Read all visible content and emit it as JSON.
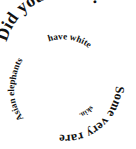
{
  "image": {
    "kind": "spiral-text-graphic",
    "width": 136,
    "height": 149,
    "background_color": "#ffffff",
    "text_color": "#111111"
  },
  "spiral": {
    "full_text": "Did you know? Some very rare Asian elephants have white skin.",
    "segments": [
      {
        "id": "segment-1",
        "text": "Did you know?",
        "ring": "outer",
        "note": "largest bold serif, arcs across the top from upper-left down the right side"
      },
      {
        "id": "segment-2",
        "text": "Some very rare",
        "ring": "mid",
        "note": "continues down the right side, inverted across the bottom"
      },
      {
        "id": "segment-3",
        "text": "Asian elephants",
        "ring": "inner",
        "note": "rises up the left side"
      },
      {
        "id": "segment-4",
        "text": "have white",
        "ring": "inner",
        "note": "arcs over the top of the inner ring"
      },
      {
        "id": "segment-5",
        "text": "skin.",
        "ring": "core",
        "note": "smallest text, innermost, near the center-bottom"
      }
    ]
  }
}
